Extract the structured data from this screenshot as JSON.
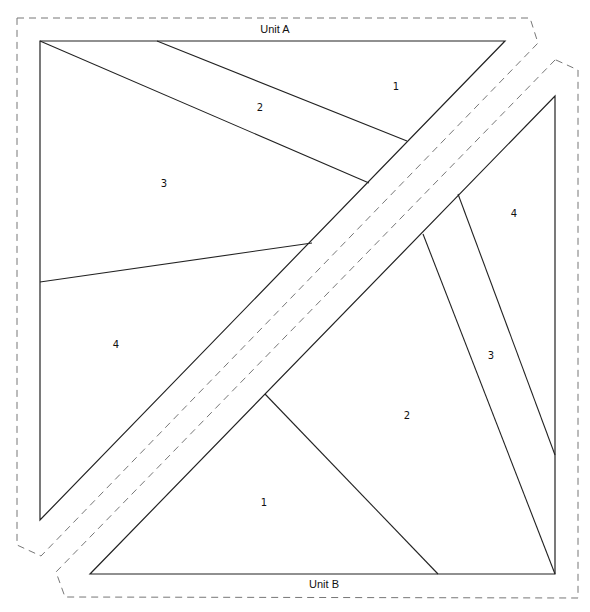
{
  "diagram": {
    "type": "foundation-paper-piecing-pattern",
    "units": [
      {
        "name": "Unit A",
        "pieces": [
          {
            "label": "1",
            "x": 396,
            "y": 87
          },
          {
            "label": "2",
            "x": 260,
            "y": 108
          },
          {
            "label": "3",
            "x": 164,
            "y": 184
          },
          {
            "label": "4",
            "x": 116,
            "y": 345
          }
        ]
      },
      {
        "name": "Unit B",
        "pieces": [
          {
            "label": "1",
            "x": 264,
            "y": 503
          },
          {
            "label": "2",
            "x": 407,
            "y": 416
          },
          {
            "label": "3",
            "x": 491,
            "y": 356
          },
          {
            "label": "4",
            "x": 514,
            "y": 214
          }
        ]
      }
    ],
    "colors": {
      "seam_line": "#222222",
      "seam_allowance_dash": "#777777",
      "background": "#ffffff"
    }
  }
}
